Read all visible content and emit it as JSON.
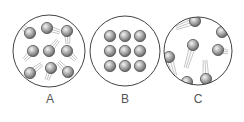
{
  "diagram": {
    "panels": [
      {
        "label": "A",
        "state": "liquid",
        "cx": 49,
        "cy": 51,
        "r": 36,
        "particles": [
          {
            "x": 30,
            "y": 33,
            "tail": [
              18,
              23
            ]
          },
          {
            "x": 47,
            "y": 28,
            "tail": [
              60,
              32
            ]
          },
          {
            "x": 67,
            "y": 31,
            "tail": [
              68,
              44
            ]
          },
          {
            "x": 33,
            "y": 51,
            "tail": [
              24,
              60
            ]
          },
          {
            "x": 49,
            "y": 51,
            "tail": [
              58,
              40
            ]
          },
          {
            "x": 67,
            "y": 51,
            "tail": [
              76,
              60
            ]
          },
          {
            "x": 30,
            "y": 73,
            "tail": [
              42,
              64
            ]
          },
          {
            "x": 51,
            "y": 68,
            "tail": [
              47,
              80
            ]
          },
          {
            "x": 68,
            "y": 72,
            "tail": [
              58,
              62
            ]
          }
        ]
      },
      {
        "label": "B",
        "state": "solid",
        "cx": 125,
        "cy": 51,
        "r": 35,
        "particles": [
          {
            "x": 110,
            "y": 36
          },
          {
            "x": 125,
            "y": 36
          },
          {
            "x": 140,
            "y": 36
          },
          {
            "x": 110,
            "y": 51
          },
          {
            "x": 125,
            "y": 51
          },
          {
            "x": 140,
            "y": 51
          },
          {
            "x": 110,
            "y": 66
          },
          {
            "x": 125,
            "y": 66
          },
          {
            "x": 140,
            "y": 66
          }
        ]
      },
      {
        "label": "C",
        "state": "gas",
        "cx": 198,
        "cy": 51,
        "r": 34,
        "particles": [
          {
            "x": 195,
            "y": 21,
            "tail": [
              176,
              28
            ]
          },
          {
            "x": 222,
            "y": 32,
            "tail": null
          },
          {
            "x": 193,
            "y": 45,
            "tail": [
              186,
              68
            ]
          },
          {
            "x": 218,
            "y": 50,
            "tail": [
              228,
              52
            ]
          },
          {
            "x": 169,
            "y": 57,
            "tail": [
              175,
              76
            ]
          },
          {
            "x": 187,
            "y": 82,
            "tail": null
          },
          {
            "x": 206,
            "y": 79,
            "tail": [
              205,
              60
            ]
          }
        ]
      }
    ]
  },
  "colors": {
    "outline": "#444444",
    "ball_light": "#f2f2f2",
    "ball_mid": "#a8a8a8",
    "ball_dark": "#5a5a5a",
    "trail": "#b5b5b5",
    "label": "#555555"
  }
}
